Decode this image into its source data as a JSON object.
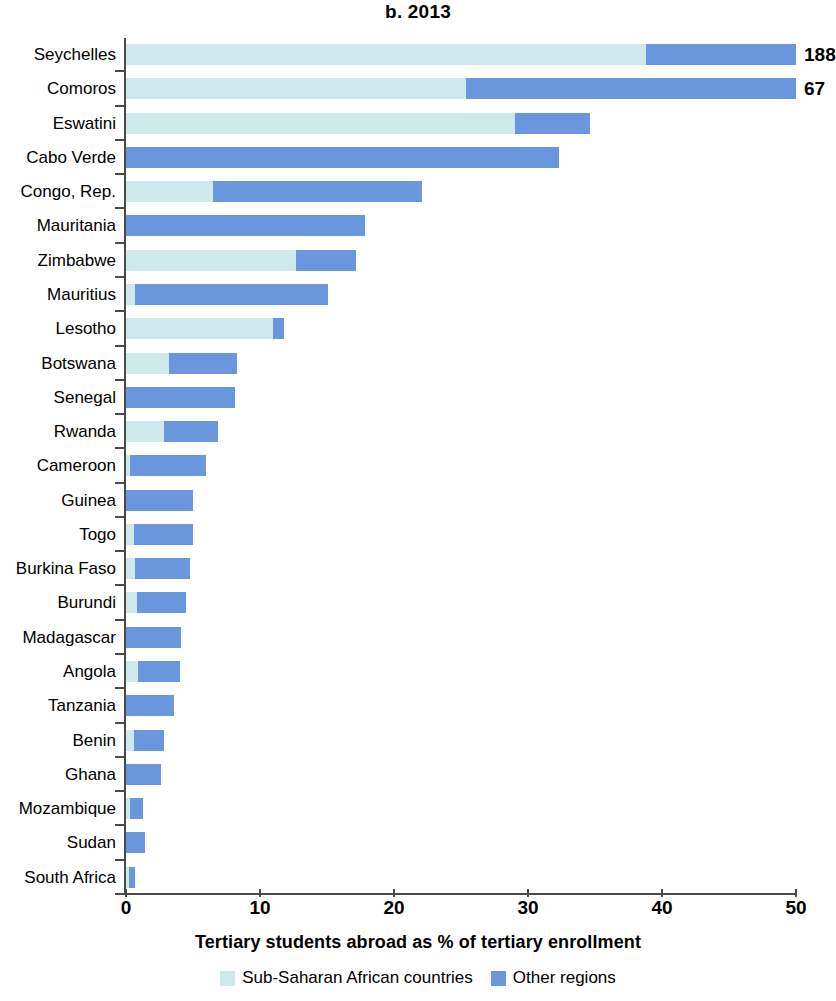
{
  "chart_data": {
    "type": "bar",
    "orientation": "horizontal",
    "stacked": true,
    "title": "b. 2013",
    "xlabel": "Tertiary students abroad as % of tertiary enrollment",
    "ylabel": "",
    "xlim": [
      0,
      50
    ],
    "xticks": [
      0,
      10,
      20,
      30,
      40,
      50
    ],
    "xtick_labels": [
      "0",
      "10",
      "20",
      "30",
      "40",
      "50"
    ],
    "grid": false,
    "legend_position": "bottom",
    "categories": [
      "Seychelles",
      "Comoros",
      "Eswatini",
      "Cabo Verde",
      "Congo, Rep.",
      "Mauritania",
      "Zimbabwe",
      "Mauritius",
      "Lesotho",
      "Botswana",
      "Senegal",
      "Rwanda",
      "Cameroon",
      "Guinea",
      "Togo",
      "Burkina Faso",
      "Burundi",
      "Madagascar",
      "Angola",
      "Tanzania",
      "Benin",
      "Ghana",
      "Mozambique",
      "Sudan",
      "South Africa"
    ],
    "series": [
      {
        "name": "Sub-Saharan African countries",
        "color": "#cfe8ec",
        "values": [
          38.8,
          25.4,
          29.0,
          0.0,
          6.5,
          0.0,
          12.7,
          0.7,
          11.0,
          3.2,
          0.0,
          2.8,
          0.3,
          0.0,
          0.6,
          0.7,
          0.8,
          0.0,
          0.9,
          0.0,
          0.6,
          0.0,
          0.3,
          0.0,
          0.2
        ]
      },
      {
        "name": "Other regions",
        "color": "#6a96de",
        "values": [
          11.2,
          24.6,
          5.6,
          32.3,
          15.6,
          17.8,
          4.5,
          14.4,
          0.8,
          5.1,
          8.1,
          4.1,
          5.7,
          5.0,
          4.4,
          4.1,
          3.7,
          4.1,
          3.1,
          3.6,
          2.2,
          2.6,
          1.0,
          1.4,
          0.5
        ]
      }
    ],
    "totals": [
      50.0,
      50.0,
      34.6,
      32.3,
      22.1,
      17.8,
      17.2,
      15.1,
      11.8,
      8.3,
      8.1,
      6.9,
      6.0,
      5.0,
      5.0,
      4.8,
      4.5,
      4.1,
      4.0,
      3.6,
      2.8,
      2.6,
      1.3,
      1.4,
      0.7
    ],
    "value_labels": [
      {
        "category": "Seychelles",
        "label": "188"
      },
      {
        "category": "Comoros",
        "label": "67"
      }
    ],
    "legend": [
      {
        "label": "Sub-Saharan African countries",
        "color": "#cfe8ec"
      },
      {
        "label": "Other regions",
        "color": "#6a96de"
      }
    ]
  }
}
